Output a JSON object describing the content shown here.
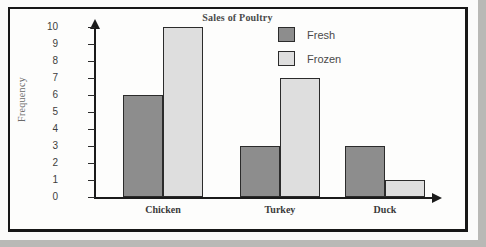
{
  "chart_data": {
    "type": "bar",
    "title": "Sales of Poultry",
    "xlabel": "",
    "ylabel": "Frequency",
    "categories": [
      "Chicken",
      "Turkey",
      "Duck"
    ],
    "series": [
      {
        "name": "Fresh",
        "color": "#8d8d8d",
        "values": [
          6,
          3,
          3
        ]
      },
      {
        "name": "Frozen",
        "color": "#dedede",
        "values": [
          10,
          7,
          1
        ]
      }
    ],
    "ylim": [
      0,
      10
    ],
    "yticks": [
      0,
      1,
      2,
      3,
      4,
      5,
      6,
      7,
      8,
      9,
      10
    ],
    "grid": false,
    "legend_position": "top-right"
  }
}
